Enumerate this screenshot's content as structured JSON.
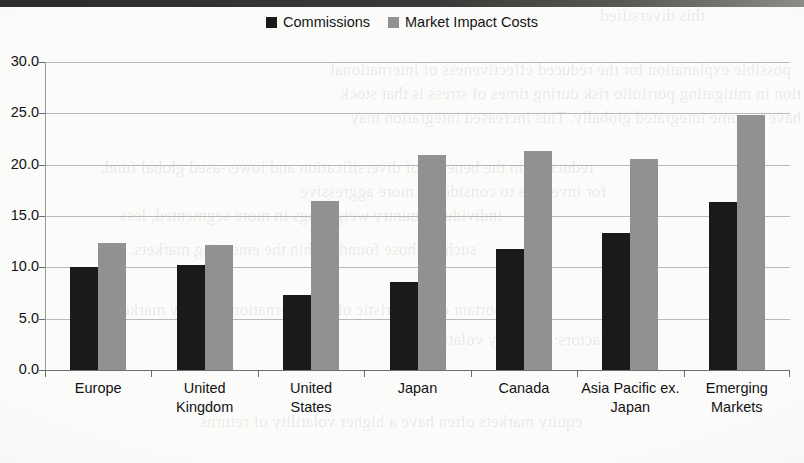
{
  "legend": {
    "items": [
      {
        "label": "Commissions",
        "color": "#1a1a1a",
        "swatch_name": "legend-swatch-commissions"
      },
      {
        "label": "Market Impact Costs",
        "color": "#919191",
        "swatch_name": "legend-swatch-market-impact-costs"
      }
    ]
  },
  "axis": {
    "y_ticks": [
      "0.0",
      "5.0",
      "10.0",
      "15.0",
      "20.0",
      "25.0",
      "30.0"
    ]
  },
  "chart_data": {
    "type": "bar",
    "title": "",
    "subtitle": "",
    "xlabel": "",
    "ylabel": "",
    "ylim": [
      0,
      30
    ],
    "ytick_step": 5,
    "grid": true,
    "legend_position": "top-center",
    "categories": [
      "Europe",
      "United Kingdom",
      "United States",
      "Japan",
      "Canada",
      "Asia Pacific ex. Japan",
      "Emerging Markets"
    ],
    "category_lines": [
      [
        "Europe"
      ],
      [
        "United",
        "Kingdom"
      ],
      [
        "United",
        "States"
      ],
      [
        "Japan"
      ],
      [
        "Canada"
      ],
      [
        "Asia Pacific ex.",
        "Japan"
      ],
      [
        "Emerging",
        "Markets"
      ]
    ],
    "series": [
      {
        "name": "Commissions",
        "color": "#1a1a1a",
        "values": [
          10.0,
          10.2,
          7.3,
          8.6,
          11.8,
          13.3,
          16.4
        ]
      },
      {
        "name": "Market Impact Costs",
        "color": "#919191",
        "values": [
          12.4,
          12.2,
          16.5,
          20.9,
          21.3,
          20.6,
          24.8
        ]
      }
    ]
  },
  "scan_artifacts": {
    "bleed_lines": [
      "this diversified",
      "possible explanation for the reduced effectiveness of international",
      "tion in mitigating portfolio risk during times of stress is that stock",
      "have become integrated globally. This increased integration may",
      "reduction in the benefits of diversification and lower-ased global fund,",
      "for investors to consider in more aggressive",
      "individual country weightings in more segmented, less",
      "such as those found within the emerging markets.",
      "important characteristic of the international equity markets",
      "factors: currency volatility",
      "equity markets often have a higher volatility of returns"
    ]
  }
}
